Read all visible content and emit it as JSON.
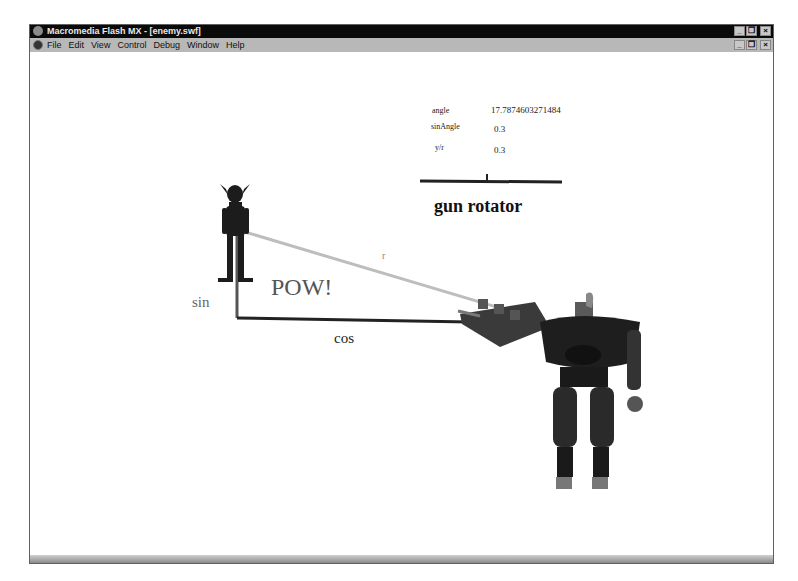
{
  "window": {
    "title": "Macromedia Flash MX - [enemy.swf]",
    "controls": [
      "minimize",
      "restore",
      "close"
    ]
  },
  "menubar": {
    "items": [
      {
        "label": "File",
        "accel": "F"
      },
      {
        "label": "Edit",
        "accel": "E"
      },
      {
        "label": "View",
        "accel": "V"
      },
      {
        "label": "Control",
        "accel": "C"
      },
      {
        "label": "Debug",
        "accel": "D"
      },
      {
        "label": "Window",
        "accel": "W"
      },
      {
        "label": "Help",
        "accel": "H"
      }
    ]
  },
  "stage": {
    "readouts": [
      {
        "label": "angle",
        "value": "17.7874603271484"
      },
      {
        "label": "sinAngle",
        "value": "0.3"
      },
      {
        "label": "y/r",
        "value": "0.3"
      }
    ],
    "slider_title": "gun rotator",
    "pow_text": "POW!",
    "sin_label": "sin",
    "cos_label": "cos",
    "r_label": "r"
  },
  "colors": {
    "titlebar": "#0a0a0a",
    "menubar": "#b8b8b8",
    "stage": "#ffffff",
    "hypotenuse": "#bcbcbc",
    "legs": "#222222"
  }
}
